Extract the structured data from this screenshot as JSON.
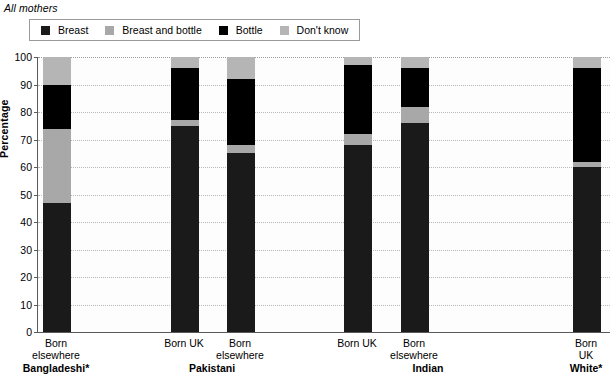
{
  "caption": "All mothers",
  "legend": {
    "items": [
      {
        "label": "Breast",
        "color": "#1a1a1a",
        "key": "breast"
      },
      {
        "label": "Breast and bottle",
        "color": "#a8a8a8",
        "key": "breast_and_bottle"
      },
      {
        "label": "Bottle",
        "color": "#000000",
        "key": "bottle"
      },
      {
        "label": "Don't know",
        "color": "#b5b5b5",
        "key": "dont_know"
      }
    ]
  },
  "axes": {
    "ylabel": "Percentage",
    "yticks": [
      0,
      10,
      20,
      30,
      40,
      50,
      60,
      70,
      80,
      90,
      100
    ],
    "ymin": 0,
    "ymax": 100
  },
  "groups": [
    {
      "name": "Bangladeshi*",
      "bars": [
        {
          "label": "Born\nelsewhere"
        }
      ]
    },
    {
      "name": "Pakistani",
      "bars": [
        {
          "label": "Born UK"
        },
        {
          "label": "Born\nelsewhere"
        }
      ]
    },
    {
      "name": "Indian",
      "bars": [
        {
          "label": "Born UK"
        },
        {
          "label": "Born\nelsewhere"
        }
      ]
    },
    {
      "name": "White*",
      "bars": [
        {
          "label": "Born UK"
        }
      ]
    }
  ],
  "chart_data": {
    "type": "bar",
    "stacked": true,
    "title": "All mothers",
    "xlabel": "",
    "ylabel": "Percentage",
    "ylim": [
      0,
      100
    ],
    "yticks": [
      0,
      10,
      20,
      30,
      40,
      50,
      60,
      70,
      80,
      90,
      100
    ],
    "grid": true,
    "legend_position": "top",
    "categories": [
      "Bangladeshi* - Born elsewhere",
      "Pakistani - Born UK",
      "Pakistani - Born elsewhere",
      "Indian - Born UK",
      "Indian - Born elsewhere",
      "White* - Born UK"
    ],
    "series": [
      {
        "name": "Breast",
        "color": "#1a1a1a",
        "values": [
          47,
          75,
          65,
          68,
          76,
          60
        ]
      },
      {
        "name": "Breast and bottle",
        "color": "#a8a8a8",
        "values": [
          27,
          2,
          3,
          4,
          6,
          2
        ]
      },
      {
        "name": "Bottle",
        "color": "#000000",
        "values": [
          16,
          19,
          24,
          25,
          14,
          34
        ]
      },
      {
        "name": "Don't know",
        "color": "#b5b5b5",
        "values": [
          10,
          4,
          8,
          3,
          4,
          4
        ]
      }
    ]
  },
  "layout": {
    "bar_x": [
      42,
      170,
      226,
      343,
      400,
      572
    ],
    "bar_width": 28,
    "group_label_x": [
      56,
      212,
      428,
      586
    ]
  }
}
